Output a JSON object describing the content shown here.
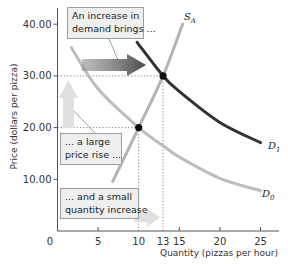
{
  "chart_data": {
    "type": "line",
    "title": "",
    "xlabel": "Quantity (pizzas per hour)",
    "ylabel": "Price (dollars per pizza)",
    "xlim": [
      0,
      27
    ],
    "ylim": [
      0,
      43
    ],
    "x_ticks": [
      0,
      5,
      10,
      13,
      15,
      20,
      25
    ],
    "x_tick_labels": [
      "0",
      "5",
      "10",
      "13",
      "15",
      "20",
      "25"
    ],
    "y_ticks": [
      10,
      20,
      30,
      40
    ],
    "y_tick_labels": [
      "10.00",
      "20.00",
      "30.00",
      "40.00"
    ],
    "grid": false,
    "series": [
      {
        "name": "S_A",
        "label_main": "S",
        "label_sub": "A",
        "color": "#b4b4b4",
        "points": [
          [
            6.8,
            9.6
          ],
          [
            10,
            20
          ],
          [
            13,
            30
          ],
          [
            15.4,
            40
          ]
        ]
      },
      {
        "name": "D_0",
        "label_main": "D",
        "label_sub": "0",
        "color": "#bdbdbd",
        "points": [
          [
            1.7,
            35.5
          ],
          [
            5,
            27.5
          ],
          [
            10,
            20
          ],
          [
            13,
            16.5
          ],
          [
            15,
            14.3
          ],
          [
            20,
            10.2
          ],
          [
            25,
            7.8
          ]
        ]
      },
      {
        "name": "D_1",
        "label_main": "D",
        "label_sub": "1",
        "color": "#333333",
        "points": [
          [
            9.8,
            36.5
          ],
          [
            13,
            30
          ],
          [
            15,
            27
          ],
          [
            20,
            21
          ],
          [
            25,
            17.1
          ]
        ]
      }
    ],
    "equilibria": [
      {
        "q": 10,
        "p": 20,
        "label": "initial equilibrium"
      },
      {
        "q": 13,
        "p": 30,
        "label": "new equilibrium"
      }
    ],
    "annotations": [
      {
        "id": "demand_increase",
        "text": [
          "An increase in",
          "demand brings ..."
        ]
      },
      {
        "id": "price_rise",
        "text": [
          "... a large",
          "price rise ..."
        ]
      },
      {
        "id": "quantity_increase",
        "text": [
          "... and a small",
          "quantity increase"
        ]
      }
    ]
  },
  "colors": {
    "axis": "#555555",
    "supply": "#b4b4b4",
    "d0": "#bdbdbd",
    "d1": "#333333",
    "shift_arrow": "#6f6f6f",
    "light_arrow": "#e0e0e0",
    "point": "#111111"
  }
}
